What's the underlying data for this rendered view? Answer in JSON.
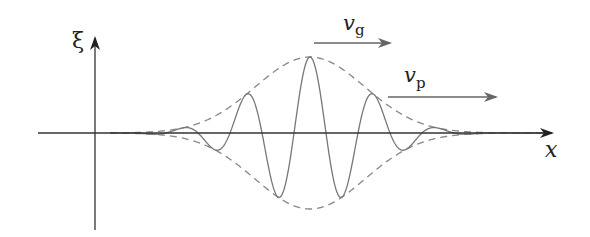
{
  "diagram": {
    "axes": {
      "vertical_label": "ξ",
      "horizontal_label": "x"
    },
    "velocities": {
      "group": {
        "symbol": "v",
        "subscript": "g"
      },
      "phase": {
        "symbol": "v",
        "subscript": "p"
      }
    },
    "wave": {
      "center_x": 310,
      "baseline_y": 133,
      "amplitude_px": 76,
      "wavelength_px": 64,
      "envelope_sigma_px": 115,
      "x_start": 110,
      "x_end": 545
    },
    "colors": {
      "axis": "#333333",
      "wave": "#777777",
      "envelope": "#888888",
      "arrow": "#666666",
      "text": "#222222"
    }
  }
}
